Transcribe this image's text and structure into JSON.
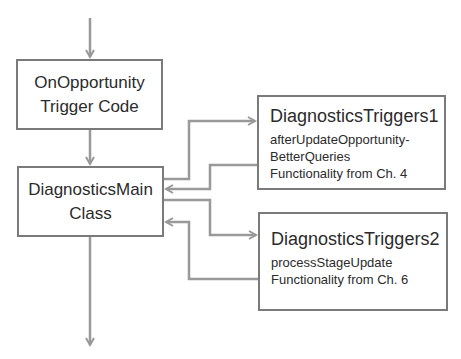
{
  "diagram": {
    "colors": {
      "connector": "#999999",
      "box_border": "#7a7a7a",
      "text": "#2b2b2b"
    },
    "nodes": {
      "trigger_code": {
        "line1": "OnOpportunity",
        "line2": "Trigger Code"
      },
      "main_class": {
        "line1": "DiagnosticsMain",
        "line2": "Class"
      },
      "triggers1": {
        "title": "DiagnosticsTriggers1",
        "lines": [
          "afterUpdateOpportunity-",
          "BetterQueries",
          "Functionality from Ch. 4"
        ]
      },
      "triggers2": {
        "title": "DiagnosticsTriggers2",
        "lines": [
          "processStageUpdate",
          "Functionality from Ch. 6"
        ]
      }
    },
    "edges": [
      {
        "from": "entry",
        "to": "trigger_code"
      },
      {
        "from": "trigger_code",
        "to": "main_class"
      },
      {
        "from": "main_class",
        "to": "triggers1"
      },
      {
        "from": "triggers1",
        "to": "main_class"
      },
      {
        "from": "main_class",
        "to": "triggers2"
      },
      {
        "from": "triggers2",
        "to": "main_class"
      },
      {
        "from": "main_class",
        "to": "exit"
      }
    ]
  }
}
